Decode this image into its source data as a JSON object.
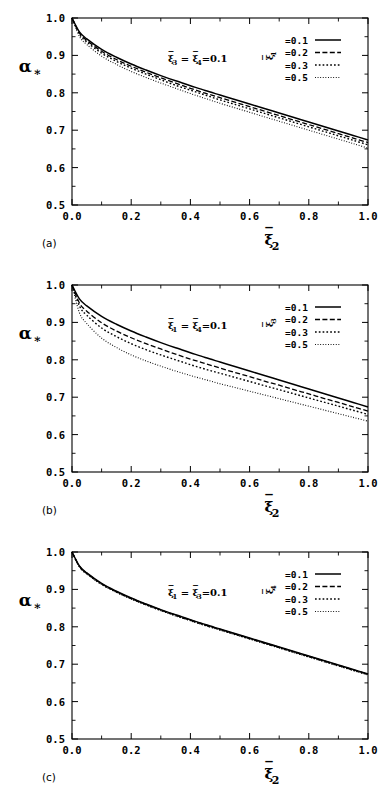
{
  "figure": {
    "background_color": "#ffffff",
    "line_color": "#000000",
    "panel_count": 3
  },
  "axes": {
    "x": {
      "label_base": "ξ",
      "label_sub": "2",
      "label_overbar": true,
      "min": 0.0,
      "max": 1.0,
      "ticks": [
        "0.0",
        "0.2",
        "0.4",
        "0.6",
        "0.8",
        "1.0"
      ],
      "tick_values": [
        0.0,
        0.2,
        0.4,
        0.6,
        0.8,
        1.0
      ],
      "minor_step": 0.1
    },
    "y": {
      "label_base": "α",
      "label_sub": "∗",
      "min": 0.5,
      "max": 1.0,
      "ticks": [
        "0.5",
        "0.6",
        "0.7",
        "0.8",
        "0.9",
        "1.0"
      ],
      "tick_values": [
        0.5,
        0.6,
        0.7,
        0.8,
        0.9,
        1.0
      ],
      "minor_step": 0.05
    }
  },
  "legend_values": [
    "=0.1",
    "=0.2",
    "=0.3",
    "=0.5"
  ],
  "line_styles": [
    "solid",
    "dashed",
    "dotted",
    "fine-dotted"
  ],
  "panels": [
    {
      "tag": "(a)",
      "annotation_html": "ξ̄<sub>3</sub> = ξ̄<sub>4</sub>=0.1",
      "annotation_text": "ξ3 = ξ4 = 0.1",
      "legend_var_base": "ξ",
      "legend_var_sub": "1",
      "fixed_params": [
        "ξ3",
        "ξ4"
      ],
      "fixed_value": 0.1,
      "varied_param": "ξ1"
    },
    {
      "tag": "(b)",
      "annotation_html": "ξ̄<sub>1</sub> = ξ̄<sub>4</sub>=0.1",
      "annotation_text": "ξ1 = ξ4 = 0.1",
      "legend_var_base": "ξ",
      "legend_var_sub": "3",
      "fixed_params": [
        "ξ1",
        "ξ4"
      ],
      "fixed_value": 0.1,
      "varied_param": "ξ3"
    },
    {
      "tag": "(c)",
      "annotation_html": "ξ̄<sub>1</sub> = ξ̄<sub>3</sub>=0.1",
      "annotation_text": "ξ1 = ξ3 = 0.1",
      "legend_var_base": "ξ",
      "legend_var_sub": "4",
      "fixed_params": [
        "ξ1",
        "ξ3"
      ],
      "fixed_value": 0.1,
      "varied_param": "ξ4"
    }
  ],
  "chart_data": [
    {
      "type": "line",
      "panel": "(a)",
      "title": "",
      "xlabel": "ξ̄2",
      "ylabel": "α*",
      "xlim": [
        0.0,
        1.0
      ],
      "ylim": [
        0.5,
        1.0
      ],
      "grid": false,
      "legend_position": "top-right",
      "annotation": "ξ̄3 = ξ̄4 = 0.1",
      "x": [
        0.0,
        0.025,
        0.05,
        0.1,
        0.15,
        0.2,
        0.25,
        0.3,
        0.35,
        0.4,
        0.45,
        0.5,
        0.55,
        0.6,
        0.65,
        0.7,
        0.75,
        0.8,
        0.85,
        0.9,
        0.95,
        1.0
      ],
      "series": [
        {
          "name": "=0.1",
          "style": "solid",
          "values": [
            1.0,
            0.963,
            0.944,
            0.916,
            0.895,
            0.877,
            0.861,
            0.846,
            0.832,
            0.819,
            0.806,
            0.794,
            0.782,
            0.77,
            0.758,
            0.746,
            0.734,
            0.722,
            0.71,
            0.698,
            0.686,
            0.674
          ]
        },
        {
          "name": "=0.2",
          "style": "dashed",
          "values": [
            1.0,
            0.96,
            0.94,
            0.911,
            0.889,
            0.871,
            0.855,
            0.84,
            0.826,
            0.812,
            0.799,
            0.787,
            0.775,
            0.763,
            0.751,
            0.739,
            0.727,
            0.715,
            0.703,
            0.691,
            0.679,
            0.667
          ]
        },
        {
          "name": "=0.3",
          "style": "dotted",
          "values": [
            1.0,
            0.957,
            0.936,
            0.906,
            0.884,
            0.866,
            0.85,
            0.835,
            0.82,
            0.807,
            0.794,
            0.781,
            0.769,
            0.757,
            0.745,
            0.733,
            0.721,
            0.709,
            0.697,
            0.685,
            0.673,
            0.661
          ]
        },
        {
          "name": "=0.5",
          "style": "fine-dotted",
          "values": [
            1.0,
            0.951,
            0.929,
            0.898,
            0.876,
            0.857,
            0.841,
            0.826,
            0.812,
            0.798,
            0.785,
            0.772,
            0.76,
            0.748,
            0.736,
            0.724,
            0.712,
            0.7,
            0.688,
            0.676,
            0.664,
            0.652
          ]
        }
      ],
      "note": "Curves nearly coincident; alpha* decreases monotonically from 1.0 to about 0.53 at xi2=1.0"
    },
    {
      "type": "line",
      "panel": "(b)",
      "title": "",
      "xlabel": "ξ̄2",
      "ylabel": "α*",
      "xlim": [
        0.0,
        1.0
      ],
      "ylim": [
        0.5,
        1.0
      ],
      "grid": false,
      "legend_position": "top-right",
      "annotation": "ξ̄1 = ξ̄4 = 0.1",
      "x": [
        0.0,
        0.025,
        0.05,
        0.1,
        0.15,
        0.2,
        0.25,
        0.3,
        0.35,
        0.4,
        0.45,
        0.5,
        0.55,
        0.6,
        0.65,
        0.7,
        0.75,
        0.8,
        0.85,
        0.9,
        0.95,
        1.0
      ],
      "series": [
        {
          "name": "=0.1",
          "style": "solid",
          "values": [
            1.0,
            0.963,
            0.944,
            0.916,
            0.895,
            0.877,
            0.861,
            0.846,
            0.832,
            0.819,
            0.806,
            0.794,
            0.782,
            0.77,
            0.758,
            0.746,
            0.734,
            0.722,
            0.71,
            0.698,
            0.686,
            0.674
          ]
        },
        {
          "name": "=0.2",
          "style": "dashed",
          "values": [
            1.0,
            0.952,
            0.93,
            0.899,
            0.877,
            0.859,
            0.843,
            0.829,
            0.815,
            0.802,
            0.79,
            0.778,
            0.766,
            0.755,
            0.743,
            0.732,
            0.72,
            0.709,
            0.697,
            0.686,
            0.674,
            0.663
          ]
        },
        {
          "name": "=0.3",
          "style": "dotted",
          "values": [
            1.0,
            0.944,
            0.919,
            0.885,
            0.862,
            0.843,
            0.827,
            0.813,
            0.8,
            0.787,
            0.775,
            0.764,
            0.753,
            0.742,
            0.731,
            0.72,
            0.709,
            0.698,
            0.687,
            0.676,
            0.665,
            0.654
          ]
        },
        {
          "name": "=0.5",
          "style": "fine-dotted",
          "values": [
            1.0,
            0.926,
            0.897,
            0.858,
            0.833,
            0.813,
            0.797,
            0.783,
            0.77,
            0.758,
            0.747,
            0.736,
            0.726,
            0.716,
            0.706,
            0.696,
            0.686,
            0.676,
            0.666,
            0.656,
            0.646,
            0.636
          ]
        }
      ],
      "note": "Curves visibly separated; the =0.5 curve lies lowest, reaching about 0.51 at xi2=1.0"
    },
    {
      "type": "line",
      "panel": "(c)",
      "title": "",
      "xlabel": "ξ̄2",
      "ylabel": "α*",
      "xlim": [
        0.0,
        1.0
      ],
      "ylim": [
        0.5,
        1.0
      ],
      "grid": false,
      "legend_position": "top-right",
      "annotation": "ξ̄1 = ξ̄3 = 0.1",
      "x": [
        0.0,
        0.025,
        0.05,
        0.1,
        0.15,
        0.2,
        0.25,
        0.3,
        0.35,
        0.4,
        0.45,
        0.5,
        0.55,
        0.6,
        0.65,
        0.7,
        0.75,
        0.8,
        0.85,
        0.9,
        0.95,
        1.0
      ],
      "series": [
        {
          "name": "=0.1",
          "style": "solid",
          "values": [
            1.0,
            0.963,
            0.944,
            0.916,
            0.895,
            0.877,
            0.861,
            0.846,
            0.832,
            0.819,
            0.806,
            0.794,
            0.782,
            0.77,
            0.758,
            0.746,
            0.734,
            0.722,
            0.71,
            0.698,
            0.686,
            0.674
          ]
        },
        {
          "name": "=0.2",
          "style": "dashed",
          "values": [
            1.0,
            0.962,
            0.943,
            0.915,
            0.894,
            0.876,
            0.86,
            0.845,
            0.831,
            0.818,
            0.805,
            0.793,
            0.781,
            0.769,
            0.757,
            0.745,
            0.733,
            0.721,
            0.709,
            0.697,
            0.685,
            0.673
          ]
        },
        {
          "name": "=0.3",
          "style": "dotted",
          "values": [
            1.0,
            0.961,
            0.942,
            0.914,
            0.893,
            0.875,
            0.859,
            0.844,
            0.83,
            0.817,
            0.804,
            0.792,
            0.78,
            0.768,
            0.756,
            0.744,
            0.732,
            0.72,
            0.708,
            0.696,
            0.684,
            0.672
          ]
        },
        {
          "name": "=0.5",
          "style": "fine-dotted",
          "values": [
            1.0,
            0.96,
            0.941,
            0.913,
            0.892,
            0.874,
            0.858,
            0.843,
            0.829,
            0.816,
            0.803,
            0.791,
            0.779,
            0.767,
            0.755,
            0.743,
            0.731,
            0.719,
            0.707,
            0.695,
            0.683,
            0.671
          ]
        }
      ],
      "note": "All four curves essentially overlap into a single visible line reaching about 0.535 at xi2=1.0"
    }
  ]
}
